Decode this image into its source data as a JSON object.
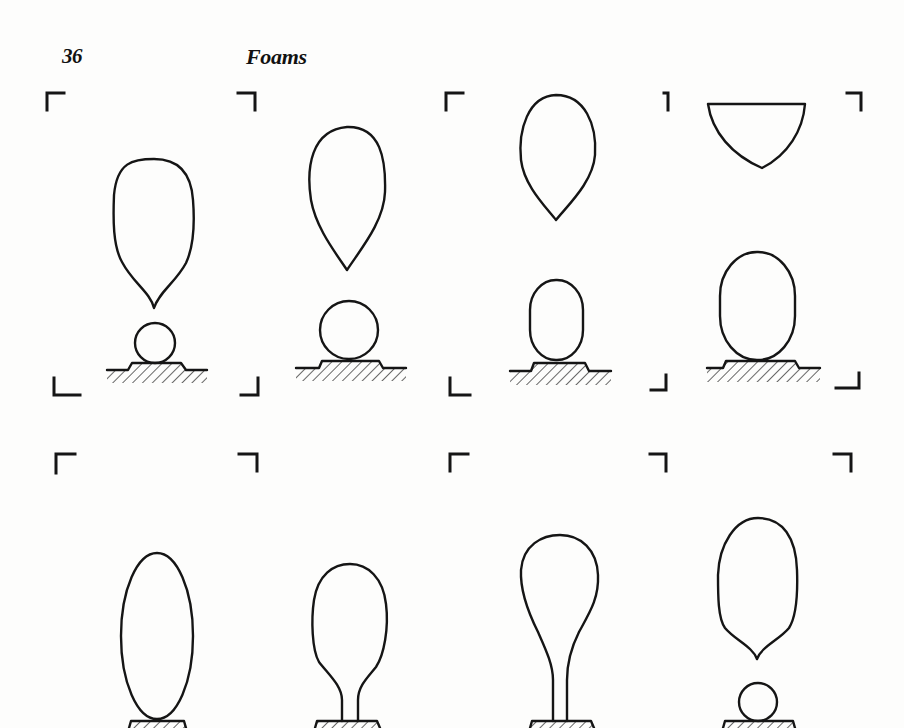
{
  "page": {
    "number": "36",
    "running_title": "Foams"
  },
  "figure": {
    "rows": [
      {
        "frames": [
          {
            "id": "r1f1",
            "top_shape": "teardrop-cusped",
            "bottom_shape": "small-circle",
            "pedestal": "wide-stepped"
          },
          {
            "id": "r1f2",
            "top_shape": "teardrop-pointed",
            "bottom_shape": "circle",
            "pedestal": "wide-stepped"
          },
          {
            "id": "r1f3",
            "top_shape": "teardrop-pointed",
            "bottom_shape": "oblong",
            "pedestal": "wide-stepped"
          },
          {
            "id": "r1f4",
            "top_shape": "cap-cut-off",
            "bottom_shape": "large-oblong",
            "pedestal": "wide-stepped"
          }
        ]
      },
      {
        "frames": [
          {
            "id": "r2f1",
            "shape": "ellipse-on-pedestal",
            "pedestal": "narrow"
          },
          {
            "id": "r2f2",
            "shape": "bulb-with-short-neck",
            "pedestal": "narrow"
          },
          {
            "id": "r2f3",
            "shape": "bulb-with-long-neck",
            "pedestal": "narrow"
          },
          {
            "id": "r2f4",
            "top_shape": "teardrop-cusped",
            "bottom_shape": "small-circle",
            "pedestal": "narrow"
          }
        ]
      }
    ]
  },
  "colors": {
    "paper": "#fdfdfc",
    "ink": "#151515"
  }
}
